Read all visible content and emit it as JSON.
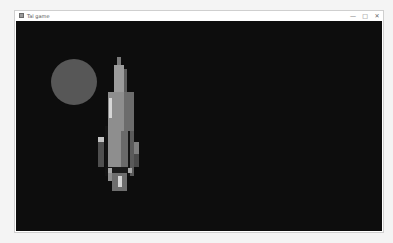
{
  "window": {
    "title": "Tal game",
    "controls": {
      "minimize": "—",
      "maximize": "□",
      "close": "✕"
    }
  },
  "canvas": {
    "background": "#0d0d0d",
    "moon": {
      "cx": 58,
      "cy": 61,
      "r": 23,
      "color": "#575757"
    },
    "rocket": {
      "parts": [
        {
          "name": "nose-tip",
          "x": 101,
          "y": 36,
          "w": 4,
          "h": 9,
          "color": "#7a7a7a"
        },
        {
          "name": "upper-body",
          "x": 98,
          "y": 44,
          "w": 10,
          "h": 28,
          "color": "#9c9c9c"
        },
        {
          "name": "upper-shade",
          "x": 108,
          "y": 48,
          "w": 3,
          "h": 24,
          "color": "#5e5e5e"
        },
        {
          "name": "mid-body",
          "x": 92,
          "y": 71,
          "w": 16,
          "h": 89,
          "color": "#8e8e8e"
        },
        {
          "name": "mid-shade",
          "x": 108,
          "y": 71,
          "w": 10,
          "h": 40,
          "color": "#6c6c6c"
        },
        {
          "name": "white-stripe",
          "x": 93,
          "y": 77,
          "w": 3,
          "h": 20,
          "color": "#d6d6d6"
        },
        {
          "name": "left-gap",
          "x": 89,
          "y": 105,
          "w": 3,
          "h": 50,
          "color": "#121212"
        },
        {
          "name": "left-fin",
          "x": 82,
          "y": 116,
          "w": 6,
          "h": 30,
          "color": "#4f4f4f"
        },
        {
          "name": "left-fin-cap",
          "x": 82,
          "y": 116,
          "w": 6,
          "h": 5,
          "color": "#c4c4c4"
        },
        {
          "name": "inner-shade",
          "x": 105,
          "y": 110,
          "w": 7,
          "h": 40,
          "color": "#6a6a6a"
        },
        {
          "name": "right-gap",
          "x": 112,
          "y": 110,
          "w": 2,
          "h": 45,
          "color": "#151515"
        },
        {
          "name": "right-body",
          "x": 114,
          "y": 110,
          "w": 4,
          "h": 45,
          "color": "#5a5a5a"
        },
        {
          "name": "right-fin",
          "x": 118,
          "y": 121,
          "w": 5,
          "h": 25,
          "color": "#4a4a4a"
        },
        {
          "name": "right-fin-cap",
          "x": 118,
          "y": 121,
          "w": 5,
          "h": 12,
          "color": "#7e7e7e"
        },
        {
          "name": "base-dark",
          "x": 92,
          "y": 146,
          "w": 20,
          "h": 6,
          "color": "#1a1a1a"
        },
        {
          "name": "base-left-light",
          "x": 92,
          "y": 147,
          "w": 4,
          "h": 5,
          "color": "#a6a6a6"
        },
        {
          "name": "base-right-light",
          "x": 112,
          "y": 147,
          "w": 4,
          "h": 5,
          "color": "#a6a6a6"
        },
        {
          "name": "flame-outer",
          "x": 96,
          "y": 152,
          "w": 15,
          "h": 18,
          "color": "#6e6e6e"
        },
        {
          "name": "flame-core",
          "x": 102,
          "y": 155,
          "w": 4,
          "h": 11,
          "color": "#d8d8d8"
        }
      ]
    }
  }
}
